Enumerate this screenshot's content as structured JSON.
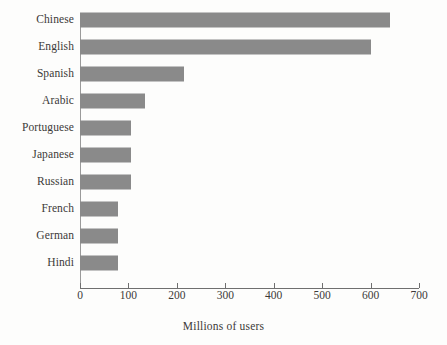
{
  "chart_data": {
    "type": "bar",
    "orientation": "horizontal",
    "title": "",
    "xlabel": "Millions of users",
    "ylabel": "",
    "categories": [
      "Chinese",
      "English",
      "Spanish",
      "Arabic",
      "Portuguese",
      "Japanese",
      "Russian",
      "French",
      "German",
      "Hindi"
    ],
    "values": [
      640,
      600,
      215,
      135,
      105,
      105,
      105,
      78,
      78,
      78
    ],
    "xlim": [
      0,
      700
    ],
    "xticks": [
      0,
      100,
      200,
      300,
      400,
      500,
      600,
      700
    ],
    "xtick_labels": [
      "0",
      "100",
      "200",
      "300",
      "400",
      "500",
      "600",
      "700"
    ],
    "grid": false,
    "legend": false,
    "bar_color": "#8a8a8a",
    "axis_color": "#6f6f6f",
    "text_color": "#3c3a38",
    "background_color": "#fdfdfc"
  }
}
